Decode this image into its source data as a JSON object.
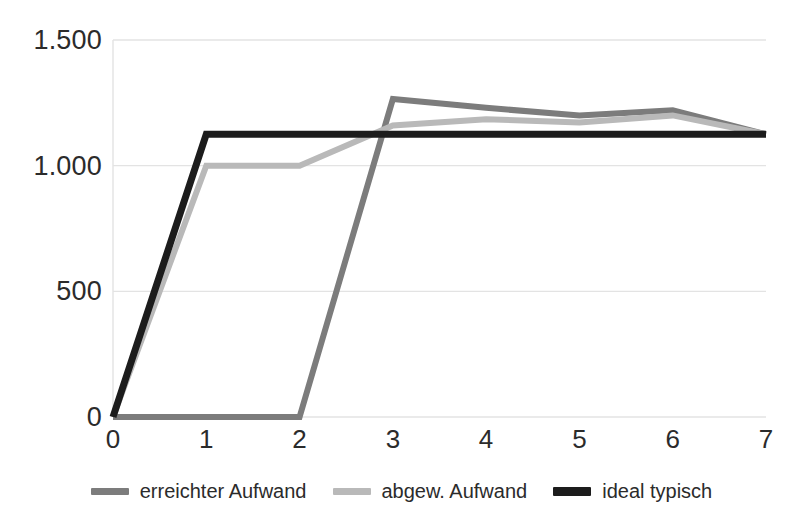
{
  "chart_data": {
    "type": "line",
    "title": "",
    "subtitle": "",
    "xlabel": "",
    "ylabel": "",
    "x": [
      0,
      1,
      2,
      3,
      4,
      5,
      6,
      7
    ],
    "xlim": [
      0,
      7
    ],
    "ylim": [
      0,
      1500
    ],
    "grid": true,
    "grid_axis": "y",
    "legend_position": "bottom",
    "x_tick_labels": [
      "0",
      "1",
      "2",
      "3",
      "4",
      "5",
      "6",
      "7"
    ],
    "y_tick_labels": [
      "0",
      "500",
      "1.000",
      "1.500"
    ],
    "y_tick_values": [
      0,
      500,
      1000,
      1500
    ],
    "series": [
      {
        "name": "erreichter Aufwand",
        "color": "#7c7c7c",
        "values": [
          0,
          0,
          0,
          1265,
          1230,
          1200,
          1220,
          1125
        ]
      },
      {
        "name": "abgew. Aufwand",
        "color": "#b9b9b9",
        "values": [
          0,
          1000,
          1000,
          1160,
          1185,
          1172,
          1200,
          1125
        ]
      },
      {
        "name": "ideal typisch",
        "color": "#1c1c1c",
        "values": [
          0,
          1125,
          1125,
          1125,
          1125,
          1125,
          1125,
          1125
        ]
      }
    ]
  },
  "legend": {
    "items": [
      {
        "label": "erreichter Aufwand",
        "color": "#7c7c7c"
      },
      {
        "label": "abgew. Aufwand",
        "color": "#b9b9b9"
      },
      {
        "label": "ideal typisch",
        "color": "#1c1c1c"
      }
    ]
  },
  "axes": {
    "y_labels": [
      "1.500",
      "1.000",
      "500",
      "0"
    ],
    "x_labels": [
      "0",
      "1",
      "2",
      "3",
      "4",
      "5",
      "6",
      "7"
    ]
  },
  "colors": {
    "background": "#ffffff",
    "gridline": "#e3e3e3",
    "text": "#2b2b2b",
    "series_dark_gray": "#7c7c7c",
    "series_light_gray": "#b9b9b9",
    "series_black": "#1c1c1c"
  }
}
